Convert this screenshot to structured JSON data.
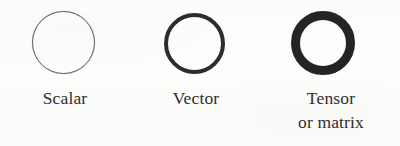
{
  "figure": {
    "background_color": "#fdfdfc",
    "items": [
      {
        "id": "scalar",
        "glyph": "thin-circle-outline",
        "label_lines": [
          "Scalar"
        ],
        "stroke_color": "#5a5a5a",
        "stroke_width_px": 1
      },
      {
        "id": "vector",
        "glyph": "medium-circle-outline",
        "label_lines": [
          "Vector"
        ],
        "stroke_color": "#2c2c2c",
        "stroke_width_px": 4
      },
      {
        "id": "tensor",
        "glyph": "thick-circle-outline",
        "label_lines": [
          "Tensor",
          "or matrix"
        ],
        "stroke_color": "#242424",
        "stroke_width_px": 10
      }
    ]
  }
}
